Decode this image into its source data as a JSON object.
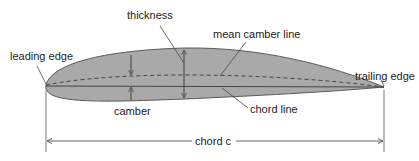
{
  "diagram": {
    "labels": {
      "thickness": "thickness",
      "mean_camber_line": "mean camber line",
      "leading_edge": "leading edge",
      "trailing_edge": "trailing edge",
      "camber": "camber",
      "chord_line": "chord line",
      "chord": "chord c"
    },
    "colors": {
      "airfoil_fill": "#a9a9a9",
      "airfoil_stroke": "#5a5a5a",
      "lines": "#555555",
      "text": "#222222"
    }
  }
}
